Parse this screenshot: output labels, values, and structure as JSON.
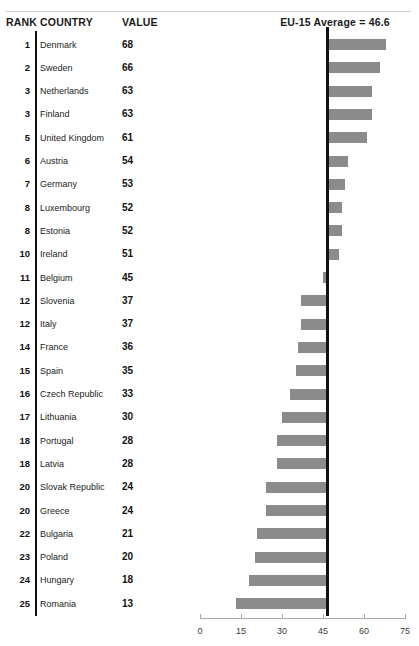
{
  "header": {
    "rank_label": "RANK",
    "country_label": "COUNTRY",
    "value_label": "VALUE",
    "average_label": "EU-15 Average = 46.6"
  },
  "chart_data": {
    "type": "bar",
    "title": "",
    "subtitle": "",
    "orientation": "horizontal",
    "baseline": 46.6,
    "baseline_label": "EU-15 Average = 46.6",
    "xlabel": "",
    "ylabel": "",
    "xlim": [
      0,
      75
    ],
    "xticks": [
      0,
      15,
      30,
      45,
      60,
      75
    ],
    "xticklabels": [
      "0",
      "15",
      "30",
      "45",
      "60",
      "75"
    ],
    "grid": false,
    "legend": false,
    "bar_color": "#8b8b8b",
    "baseline_color": "#111111",
    "categories": [
      "Denmark",
      "Sweden",
      "Netherlands",
      "Finland",
      "United Kingdom",
      "Austria",
      "Germany",
      "Luxembourg",
      "Estonia",
      "Ireland",
      "Belgium",
      "Slovenia",
      "Italy",
      "France",
      "Spain",
      "Czech Republic",
      "Lithuania",
      "Portugal",
      "Latvia",
      "Slovak Republic",
      "Greece",
      "Bulgaria",
      "Poland",
      "Hungary",
      "Romania"
    ],
    "values": [
      68,
      66,
      63,
      63,
      61,
      54,
      53,
      52,
      52,
      51,
      45,
      37,
      37,
      36,
      35,
      33,
      30,
      28,
      28,
      24,
      24,
      21,
      20,
      18,
      13
    ],
    "ranks": [
      1,
      2,
      3,
      3,
      5,
      6,
      7,
      8,
      8,
      10,
      11,
      12,
      12,
      14,
      15,
      16,
      17,
      18,
      18,
      20,
      20,
      22,
      23,
      24,
      25
    ]
  },
  "rows": [
    {
      "rank": "1",
      "country": "Denmark",
      "value": "68"
    },
    {
      "rank": "2",
      "country": "Sweden",
      "value": "66"
    },
    {
      "rank": "3",
      "country": "Netherlands",
      "value": "63"
    },
    {
      "rank": "3",
      "country": "Finland",
      "value": "63"
    },
    {
      "rank": "5",
      "country": "United Kingdom",
      "value": "61"
    },
    {
      "rank": "6",
      "country": "Austria",
      "value": "54"
    },
    {
      "rank": "7",
      "country": "Germany",
      "value": "53"
    },
    {
      "rank": "8",
      "country": "Luxembourg",
      "value": "52"
    },
    {
      "rank": "8",
      "country": "Estonia",
      "value": "52"
    },
    {
      "rank": "10",
      "country": "Ireland",
      "value": "51"
    },
    {
      "rank": "11",
      "country": "Belgium",
      "value": "45"
    },
    {
      "rank": "12",
      "country": "Slovenia",
      "value": "37"
    },
    {
      "rank": "12",
      "country": "Italy",
      "value": "37"
    },
    {
      "rank": "14",
      "country": "France",
      "value": "36"
    },
    {
      "rank": "15",
      "country": "Spain",
      "value": "35"
    },
    {
      "rank": "16",
      "country": "Czech Republic",
      "value": "33"
    },
    {
      "rank": "17",
      "country": "Lithuania",
      "value": "30"
    },
    {
      "rank": "18",
      "country": "Portugal",
      "value": "28"
    },
    {
      "rank": "18",
      "country": "Latvia",
      "value": "28"
    },
    {
      "rank": "20",
      "country": "Slovak Republic",
      "value": "24"
    },
    {
      "rank": "20",
      "country": "Greece",
      "value": "24"
    },
    {
      "rank": "22",
      "country": "Bulgaria",
      "value": "21"
    },
    {
      "rank": "23",
      "country": "Poland",
      "value": "20"
    },
    {
      "rank": "24",
      "country": "Hungary",
      "value": "18"
    },
    {
      "rank": "25",
      "country": "Romania",
      "value": "13"
    }
  ],
  "axis": {
    "labels": [
      "0",
      "15",
      "30",
      "45",
      "60",
      "75"
    ]
  }
}
